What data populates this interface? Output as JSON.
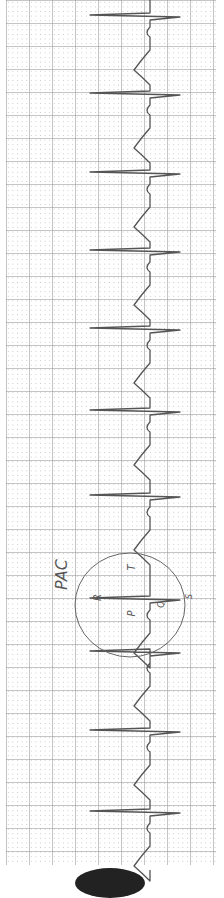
{
  "image": {
    "description": "Hand-drawn ECG rhythm strip on grid paper, rotated vertically",
    "annotation": {
      "label": "PAC",
      "wave_letters": [
        "P",
        "Q",
        "R",
        "S",
        "T"
      ],
      "circled_beat_index": 7
    },
    "rhythm": {
      "qrs_positions_y": [
        15,
        93,
        172,
        250,
        328,
        410,
        495,
        598,
        651,
        730,
        811
      ],
      "baseline_x": 150
    },
    "colors": {
      "trace": "#555555",
      "grid": "#aaaaaa",
      "paper": "#ffffff"
    }
  }
}
